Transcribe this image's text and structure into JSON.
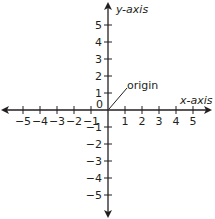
{
  "diagram": {
    "type": "cartesian-coordinate-plane",
    "x_axis_label": "x-axis",
    "y_axis_label": "y-axis",
    "origin_label": "origin",
    "origin_tick_label": "0",
    "x_ticks": [
      {
        "value": -5,
        "label": "−5"
      },
      {
        "value": -4,
        "label": "−4"
      },
      {
        "value": -3,
        "label": "−3"
      },
      {
        "value": -2,
        "label": "−2"
      },
      {
        "value": -1,
        "label": "−1"
      },
      {
        "value": 1,
        "label": "1"
      },
      {
        "value": 2,
        "label": "2"
      },
      {
        "value": 3,
        "label": "3"
      },
      {
        "value": 4,
        "label": "4"
      },
      {
        "value": 5,
        "label": "5"
      }
    ],
    "y_ticks": [
      {
        "value": 5,
        "label": "5"
      },
      {
        "value": 4,
        "label": "4"
      },
      {
        "value": 3,
        "label": "3"
      },
      {
        "value": 2,
        "label": "2"
      },
      {
        "value": 1,
        "label": "1"
      },
      {
        "value": -1,
        "label": "−1"
      },
      {
        "value": -2,
        "label": "−2"
      },
      {
        "value": -3,
        "label": "−3"
      },
      {
        "value": -4,
        "label": "−4"
      },
      {
        "value": -5,
        "label": "−5"
      }
    ],
    "range": {
      "x": [
        -5,
        5
      ],
      "y": [
        -5,
        5
      ]
    },
    "colors": {
      "axis": "#231f20",
      "text": "#231f20",
      "background": "#ffffff"
    }
  }
}
